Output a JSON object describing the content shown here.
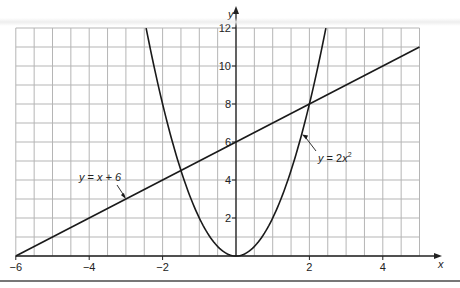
{
  "chart_data": {
    "type": "line",
    "title": "",
    "xlabel": "x",
    "ylabel": "y",
    "xlim": [
      -6,
      5
    ],
    "ylim": [
      0,
      12
    ],
    "grid": true,
    "grid_spacing": {
      "x": 0.5,
      "y": 1
    },
    "x_ticks": [
      -6,
      -4,
      -2,
      2,
      4
    ],
    "x_tick_labels": [
      "−6",
      "−4",
      "−2",
      "2",
      "4"
    ],
    "y_ticks": [
      2,
      4,
      6,
      8,
      10,
      12
    ],
    "y_tick_labels": [
      "2",
      "4",
      "6",
      "8",
      "10",
      "12"
    ],
    "series": [
      {
        "name": "y = x + 6",
        "kind": "linear",
        "equation": "y = x + 6",
        "x": [
          -6,
          5
        ],
        "y": [
          0,
          11
        ]
      },
      {
        "name": "y = 2x²",
        "kind": "quadratic",
        "equation": "y = 2x^2",
        "x": [
          -2.449,
          -2,
          -1.5,
          -1,
          -0.5,
          0,
          0.5,
          1,
          1.5,
          2,
          2.449
        ],
        "y": [
          12,
          8,
          4.5,
          2,
          0.5,
          0,
          0.5,
          2,
          4.5,
          8,
          12
        ]
      }
    ],
    "intersections": [
      {
        "x": -1.5,
        "y": 4.5
      },
      {
        "x": 2,
        "y": 8
      }
    ],
    "annotations": [
      {
        "text": "y = x + 6",
        "points_to": {
          "x": -3,
          "y": 3
        }
      },
      {
        "text": "y = 2x²",
        "points_to": {
          "x": 1.8,
          "y": 6.4
        }
      }
    ]
  },
  "labels": {
    "x_axis": "x",
    "y_axis": "y",
    "line_label": {
      "lhs": "y",
      "eq": " = ",
      "rhs": "x + 6"
    },
    "parabola_label": {
      "lhs": "y",
      "eq": " = 2",
      "var": "x",
      "exp": "2"
    }
  },
  "colors": {
    "grid": "#b5b5b5",
    "axis": "#222222",
    "curve": "#1a1a1a",
    "background": "#ffffff",
    "rule": "#777777"
  }
}
